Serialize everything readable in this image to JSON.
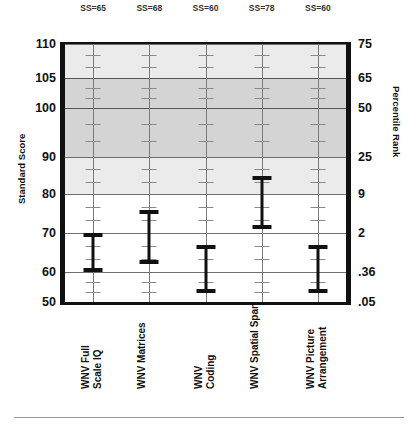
{
  "chart_data": {
    "type": "bar",
    "subtype": "error-bar-confidence-interval-profile",
    "title": "",
    "xlabel": "",
    "ylabel": "Standard Score",
    "y2label": "Percentile Rank",
    "ylim": [
      50,
      110
    ],
    "grid": true,
    "legend": false,
    "categories": [
      "WNV Full Scale IQ",
      "WNV Matrices",
      "WNV Coding",
      "WNV Spatial Span",
      "WNV Picture Arrangement"
    ],
    "values": [
      65,
      68,
      60,
      78,
      60
    ],
    "point_labels": [
      "SS=65",
      "SS=68",
      "SS=60",
      "SS=78",
      "SS=60"
    ],
    "series": [
      {
        "name": "Confidence interval",
        "lower": [
          60,
          62,
          53,
          71,
          53
        ],
        "upper": [
          70,
          76,
          67,
          85,
          67
        ]
      }
    ],
    "yticks": [
      110,
      105,
      100,
      90,
      80,
      70,
      60,
      50
    ],
    "yticklabels": [
      "110",
      "105",
      "100",
      "90",
      "80",
      "70",
      "60",
      "50"
    ],
    "y2ticks": [
      75,
      65,
      50,
      25,
      9,
      2,
      0.36,
      0.05
    ],
    "y2ticklabels": [
      "75",
      "65",
      "50",
      "25",
      "9",
      "2",
      ".36",
      ".05"
    ],
    "shaded_bands": [
      {
        "name": "average-range-light",
        "from": 80,
        "to": 110,
        "color": "#ebebeb"
      },
      {
        "name": "average-range-dark",
        "from": 90,
        "to": 105,
        "color": "#d4d4d4"
      }
    ],
    "colors": {
      "errorbar": "#111111",
      "gridline": "#6f6f6f",
      "axis": "#111111",
      "band_light": "#ebebeb",
      "band_dark": "#d4d4d4"
    }
  }
}
